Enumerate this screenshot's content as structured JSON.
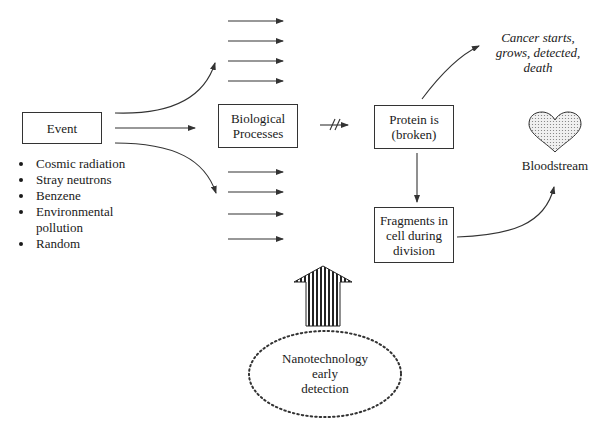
{
  "diagram": {
    "nodes": {
      "event": {
        "label": "Event"
      },
      "biological_processes": {
        "label_line1": "Biological",
        "label_line2": "Processes"
      },
      "protein": {
        "label_line1": "Protein is",
        "label_line2": "(broken)"
      },
      "fragments": {
        "label_line1": "Fragments in",
        "label_line2": "cell during",
        "label_line3": "division"
      },
      "cancer_outcome": {
        "line1": "Cancer starts,",
        "line2": "grows, detected,",
        "line3": "death"
      },
      "bloodstream": {
        "label": "Bloodstream",
        "icon": "heart-icon"
      },
      "nanotech": {
        "line1": "Nanotechnology",
        "line2": "early",
        "line3": "detection"
      }
    },
    "event_causes": [
      "Cosmic radiation",
      "Stray neutrons",
      "Benzene",
      "Environmental",
      "pollution",
      "Random"
    ],
    "edges": [
      {
        "from": "event",
        "to": "upper-parallel-arrows",
        "style": "curved"
      },
      {
        "from": "event",
        "to": "biological_processes",
        "style": "straight"
      },
      {
        "from": "event",
        "to": "lower-parallel-arrows",
        "style": "curved"
      },
      {
        "from": "biological_processes",
        "to": "protein",
        "style": "broken (//)"
      },
      {
        "from": "protein",
        "to": "cancer_outcome",
        "style": "curved"
      },
      {
        "from": "protein",
        "to": "fragments",
        "style": "straight"
      },
      {
        "from": "fragments",
        "to": "bloodstream",
        "style": "curved"
      },
      {
        "from": "nanotech",
        "to": "biological_processes-area",
        "style": "striped block arrow"
      }
    ],
    "parallel_arrows": {
      "upper_count": 4,
      "lower_count": 4
    },
    "colors": {
      "line": "#333333",
      "heart_fill": "#d9d9d9",
      "background": "#ffffff"
    }
  }
}
